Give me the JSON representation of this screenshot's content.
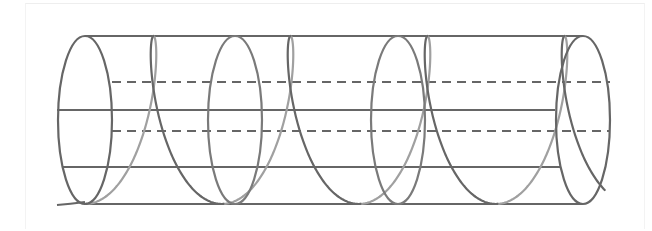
{
  "diagram": {
    "colors": {
      "front": "#666666",
      "back": "#a0a0a0",
      "background": "#ffffff"
    },
    "cylinder": {
      "x_start": 85,
      "x_end": 583,
      "y_top": 36,
      "y_bottom": 204,
      "end_rx": 27,
      "cross_sections_x": [
        85,
        235,
        398,
        583
      ]
    },
    "guide_lines": [
      {
        "y": 36,
        "style": "solid",
        "x1": 85,
        "x2": 583
      },
      {
        "y": 82,
        "style": "dashed",
        "x1": 112,
        "x2": 610
      },
      {
        "y": 110,
        "style": "solid",
        "x1": 57,
        "x2": 555
      },
      {
        "y": 131,
        "style": "dashed",
        "x1": 112,
        "x2": 610
      },
      {
        "y": 167,
        "style": "solid",
        "x1": 62,
        "x2": 560
      },
      {
        "y": 204,
        "style": "solid",
        "x1": 85,
        "x2": 583
      }
    ],
    "helix": {
      "start_x": 57,
      "end_x": 605,
      "turns": 4,
      "period_px": 137,
      "lean_px": 28
    }
  }
}
